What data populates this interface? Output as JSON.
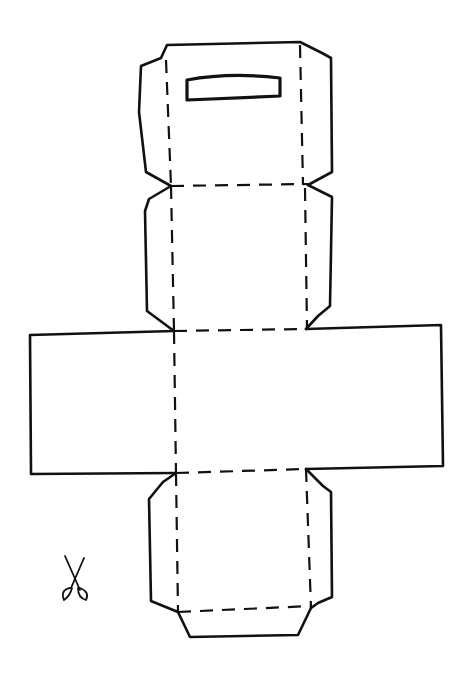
{
  "diagram": {
    "title": "Box net cut-out template",
    "legend": {
      "cut_line": "solid line = cut",
      "fold_line": "dashed line = fold"
    },
    "colors": {
      "background": "#ffffff",
      "ink": "#111111"
    },
    "cut_paths": [
      {
        "name": "top-flap-outline",
        "d": "M171,186 L146,172 L139,112 L141,66 L161,58 L167,45 L300,42 L322,53 L331,58 L332,172 L308,185"
      },
      {
        "name": "upper-panel-left-side",
        "d": "M171,186 L149,199 L145,211 L147,311 L174,331"
      },
      {
        "name": "upper-panel-right-side",
        "d": "M308,185 L326,194 L332,197 L330,306 L318,316 L306,329"
      },
      {
        "name": "middle-band-left",
        "d": "M174,331 L30,335 L31,474 L176,473"
      },
      {
        "name": "middle-band-right",
        "d": "M306,329 L441,325 L443,466 L306,469"
      },
      {
        "name": "lower-panel-left-side",
        "d": "M176,473 L163,482 L149,499 L151,601 L178,612"
      },
      {
        "name": "lower-panel-right-side",
        "d": "M306,469 L323,486 L331,492 L332,597 L318,603 L311,608"
      },
      {
        "name": "bottom-tab",
        "d": "M178,612 L190,637 L298,635 L311,608"
      }
    ],
    "fold_paths": [
      {
        "name": "top-left-fold",
        "d": "M166,60 L171,186"
      },
      {
        "name": "top-right-fold",
        "d": "M300,45 L303,185"
      },
      {
        "name": "top-horizontal-fold",
        "d": "M171,186 L308,184"
      },
      {
        "name": "upper-left-fold",
        "d": "M171,186 L174,331"
      },
      {
        "name": "upper-right-fold",
        "d": "M305,188 L307,329"
      },
      {
        "name": "upper-horizontal-fold",
        "d": "M174,331 L306,329"
      },
      {
        "name": "middle-left-fold",
        "d": "M174,331 L176,473"
      },
      {
        "name": "middle-horizontal-fold",
        "d": "M176,473 L306,469"
      },
      {
        "name": "lower-left-fold",
        "d": "M176,473 L178,612"
      },
      {
        "name": "lower-right-fold",
        "d": "M306,469 L311,608"
      },
      {
        "name": "lower-horizontal-fold",
        "d": "M178,612 L311,606"
      }
    ],
    "slot": {
      "name": "handle-slot",
      "d": "M187,80 Q230,72 280,78 L280,96 L187,100 Z"
    },
    "scissors": {
      "blade_1": "M65,556 L80,590",
      "blade_2": "M84,558 L71,588",
      "handle_1": "M70,588 Q60,590 64,600 Q70,596 72,588",
      "handle_2": "M80,588 Q90,592 86,600 Q78,598 78,588"
    }
  }
}
